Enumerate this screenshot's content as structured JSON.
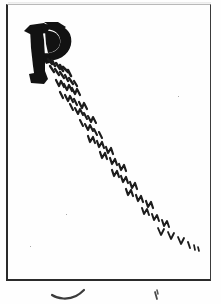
{
  "document": {
    "kind": "manuscript-page-scan",
    "title": "Manuscript leaf fragment",
    "background_color": "#fefefe",
    "ink_color": "#1b1b1b",
    "frame": {
      "label": "ruled ink border",
      "left_rule_color": "#2a2a2a",
      "right_rule_color": "#3a3a3a",
      "top_rule_color": "#b9b9b9",
      "bottom_rule_color": "#2b2b2b"
    }
  },
  "content": {
    "initial": {
      "letter": "P",
      "style": "blackletter-gothic-capital",
      "description": "Large drop-capital P with heavy vertical stem and filled bowl",
      "color": "#121212"
    },
    "script_line": {
      "label": "diagonal cursive line",
      "legibility": "illegible",
      "description": "Single descending line of minim-stroke cursive script running from the foot of the initial toward the lower right corner",
      "direction": "top-left to bottom-right",
      "stroke_count": 58,
      "color": "#1c1c1c"
    },
    "below_frame": {
      "label": "cut-off glyph tops",
      "left_mark": "~",
      "right_mark": "'",
      "description": "Faint tops of a second line of writing cropped by the image edge"
    }
  },
  "metrics": {
    "width_px": 221,
    "height_px": 304
  }
}
